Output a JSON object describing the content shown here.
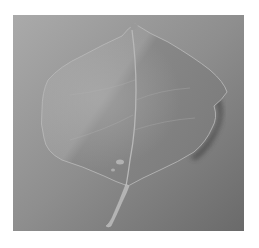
{
  "image": {
    "subject": "leaf",
    "description": "Grayscale photograph of a single broad leaf with a stem, lying on a gray background",
    "colors": {
      "page_background": "#ffffff",
      "background_light": "#a9a9a9",
      "background_dark": "#6c6c6c",
      "leaf_light": "#a3a3a3",
      "leaf_dark": "#7b7b7b",
      "vein": "#b5b5b5",
      "stem": "#b2b2b2",
      "shadow": "#3e3e3e"
    }
  }
}
